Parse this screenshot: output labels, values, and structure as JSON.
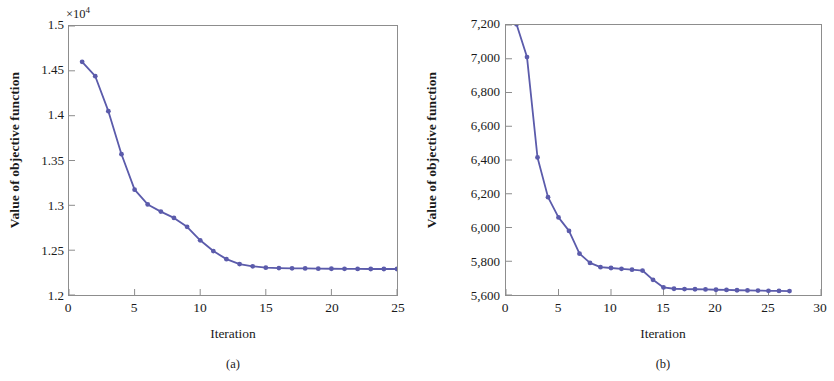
{
  "figure": {
    "panels": [
      {
        "caption": "(a)",
        "exponent_label": "×10",
        "exponent_sup": "4",
        "xlabel": "Iteration",
        "ylabel": "Value of objective function",
        "xticks": [
          "0",
          "5",
          "10",
          "15",
          "20",
          "25"
        ],
        "yticks": [
          "1.2",
          "1.25",
          "1.3",
          "1.35",
          "1.4",
          "1.45",
          "1.5"
        ]
      },
      {
        "caption": "(b)",
        "exponent_label": "",
        "exponent_sup": "",
        "xlabel": "Iteration",
        "ylabel": "Value of objective function",
        "xticks": [
          "0",
          "5",
          "10",
          "15",
          "20",
          "25",
          "30"
        ],
        "yticks": [
          "5,600",
          "5,800",
          "6,000",
          "6,200",
          "6,400",
          "6,600",
          "6,800",
          "7,000",
          "7,200"
        ]
      }
    ],
    "colors": {
      "line": "#5b5bab",
      "marker": "#5b5bab",
      "axis": "#8d8d8d",
      "text": "#1a1a1a",
      "background": "#ffffff"
    }
  },
  "chart_data": [
    {
      "type": "line",
      "panel": "(a)",
      "title": "",
      "xlabel": "Iteration",
      "ylabel": "Value of objective function",
      "y_exponent_label": "×10^4",
      "xlim": [
        0,
        25
      ],
      "ylim": [
        12000,
        15000
      ],
      "xticks": [
        0,
        5,
        10,
        15,
        20,
        25
      ],
      "yticks": [
        12000,
        12500,
        13000,
        13500,
        14000,
        14500,
        15000
      ],
      "ytick_labels": [
        "1.2",
        "1.25",
        "1.3",
        "1.35",
        "1.4",
        "1.45",
        "1.5"
      ],
      "grid": false,
      "legend": null,
      "markers": "filled-circle",
      "series": [
        {
          "name": "Objective value",
          "x": [
            1,
            2,
            3,
            4,
            5,
            6,
            7,
            8,
            9,
            10,
            11,
            12,
            13,
            14,
            15,
            16,
            17,
            18,
            19,
            20,
            21,
            22,
            23,
            24,
            25
          ],
          "y": [
            14600,
            14440,
            14050,
            13570,
            13175,
            13010,
            12930,
            12860,
            12760,
            12610,
            12490,
            12400,
            12345,
            12320,
            12305,
            12300,
            12298,
            12296,
            12294,
            12293,
            12292,
            12291,
            12290,
            12290,
            12290
          ]
        }
      ]
    },
    {
      "type": "line",
      "panel": "(b)",
      "title": "",
      "xlabel": "Iteration",
      "ylabel": "Value of objective function",
      "y_exponent_label": "",
      "xlim": [
        0,
        30
      ],
      "ylim": [
        5600,
        7200
      ],
      "xticks": [
        0,
        5,
        10,
        15,
        20,
        25,
        30
      ],
      "yticks": [
        5600,
        5800,
        6000,
        6200,
        6400,
        6600,
        6800,
        7000,
        7200
      ],
      "ytick_labels": [
        "5,600",
        "5,800",
        "6,000",
        "6,200",
        "6,400",
        "6,600",
        "6,800",
        "7,000",
        "7,200"
      ],
      "grid": false,
      "legend": null,
      "markers": "filled-circle",
      "series": [
        {
          "name": "Objective value",
          "x": [
            1,
            2,
            3,
            4,
            5,
            6,
            7,
            8,
            9,
            10,
            11,
            12,
            13,
            14,
            15,
            16,
            17,
            18,
            19,
            20,
            21,
            22,
            23,
            24,
            25,
            26,
            27
          ],
          "y": [
            7205,
            7010,
            6415,
            6180,
            6060,
            5980,
            5845,
            5790,
            5765,
            5760,
            5755,
            5750,
            5745,
            5690,
            5645,
            5637,
            5635,
            5634,
            5633,
            5631,
            5630,
            5628,
            5627,
            5626,
            5625,
            5624,
            5623
          ]
        }
      ]
    }
  ]
}
